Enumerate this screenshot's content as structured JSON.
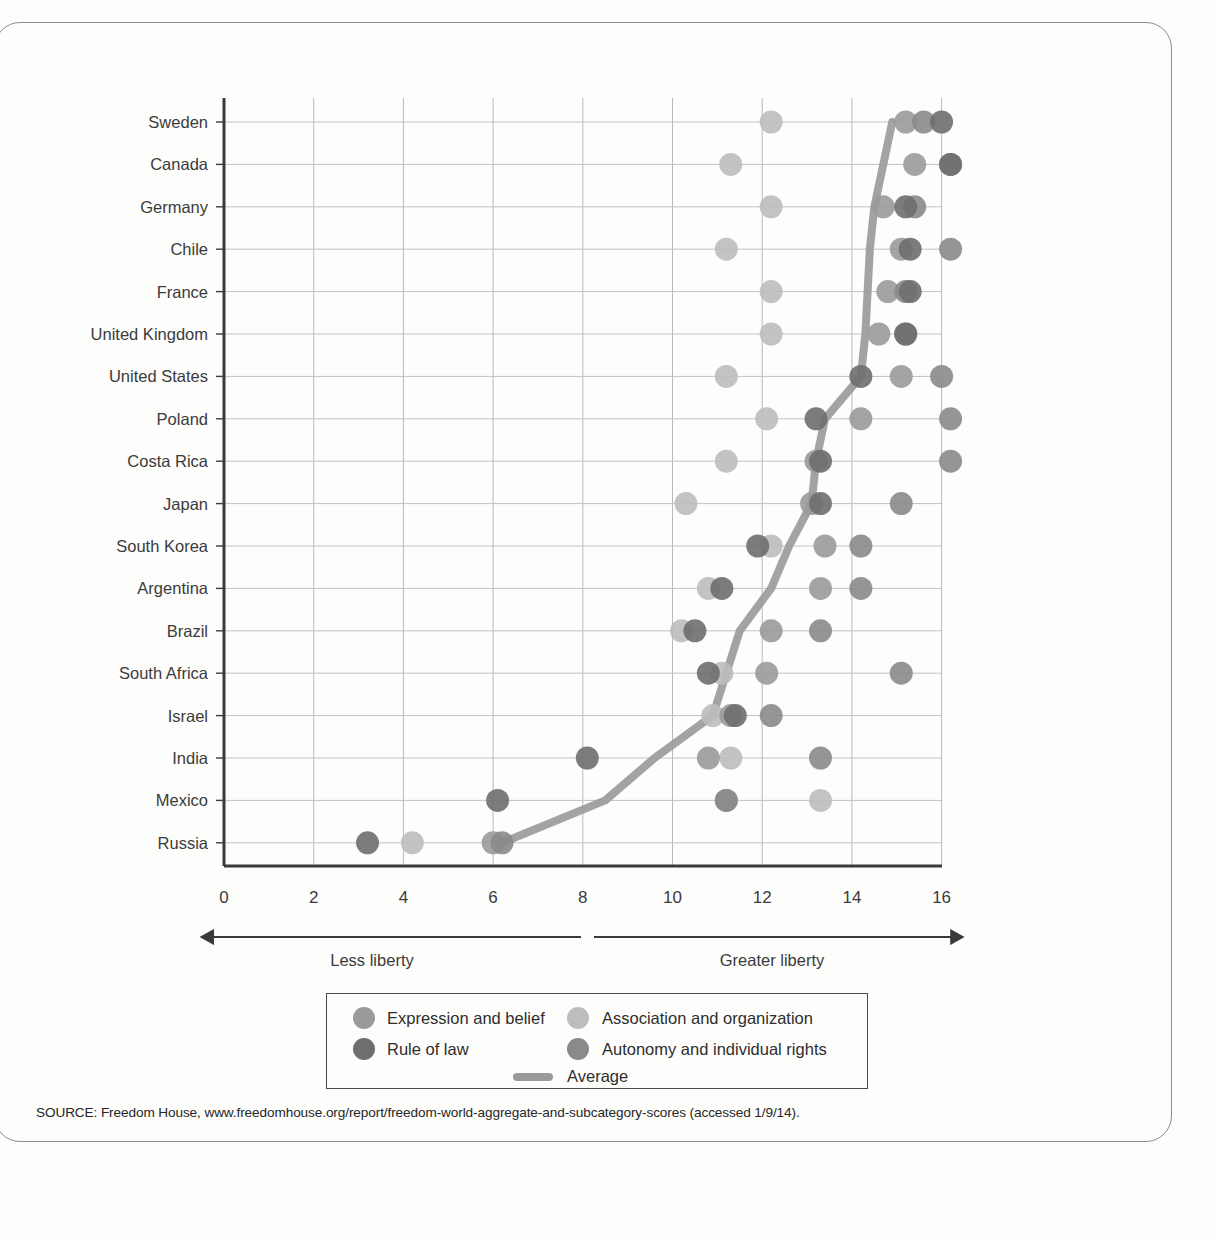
{
  "chart_data": {
    "type": "scatter",
    "title": "",
    "subtitle": "",
    "xlabel": "",
    "ylabel": "",
    "xlim": [
      0,
      16.6
    ],
    "xticks": [
      0,
      2,
      4,
      6,
      8,
      10,
      12,
      14,
      16
    ],
    "xticklabels": [
      "0",
      "2",
      "4",
      "6",
      "8",
      "10",
      "12",
      "14",
      "16"
    ],
    "grid": true,
    "legend_position": "bottom-center",
    "axis_captions": {
      "left": "Less liberty",
      "right": "Greater liberty"
    },
    "categories": [
      "Sweden",
      "Canada",
      "Germany",
      "Chile",
      "France",
      "United Kingdom",
      "United States",
      "Poland",
      "Costa Rica",
      "Japan",
      "South Korea",
      "Argentina",
      "Brazil",
      "South Africa",
      "Israel",
      "India",
      "Mexico",
      "Russia"
    ],
    "series": [
      {
        "name": "Expression and belief",
        "key": "expression",
        "color": "#9a9a9a",
        "values": [
          15.2,
          15.4,
          14.7,
          15.1,
          14.8,
          14.6,
          15.1,
          14.2,
          13.2,
          13.1,
          13.4,
          13.3,
          12.2,
          12.1,
          11.3,
          10.8,
          11.2,
          6.0
        ]
      },
      {
        "name": "Association and organization",
        "key": "association",
        "color": "#bdbdbd",
        "values": [
          12.2,
          11.3,
          12.2,
          11.2,
          12.2,
          12.2,
          11.2,
          12.1,
          11.2,
          10.3,
          12.2,
          10.8,
          10.2,
          11.1,
          10.9,
          11.3,
          13.3,
          4.2
        ]
      },
      {
        "name": "Rule of law",
        "key": "rule_of_law",
        "color": "#6e6e6e",
        "values": [
          16.0,
          16.2,
          15.2,
          15.3,
          15.3,
          15.2,
          14.2,
          13.2,
          13.3,
          13.3,
          11.9,
          11.1,
          10.5,
          10.8,
          11.4,
          8.1,
          6.1,
          3.2
        ]
      },
      {
        "name": "Autonomy and individual rights",
        "key": "autonomy",
        "color": "#8a8a8a",
        "values": [
          15.6,
          16.2,
          15.4,
          16.2,
          15.2,
          15.2,
          16.0,
          16.2,
          16.2,
          15.1,
          14.2,
          14.2,
          13.3,
          15.1,
          12.2,
          13.3,
          11.2,
          6.2
        ]
      }
    ],
    "average": {
      "name": "Average",
      "color": "#9b9b9b",
      "values": [
        14.9,
        14.7,
        14.5,
        14.4,
        14.35,
        14.3,
        14.2,
        13.4,
        13.2,
        13.1,
        12.6,
        12.2,
        11.5,
        11.2,
        10.9,
        9.6,
        8.5,
        6.2
      ]
    }
  },
  "legend": {
    "items": [
      {
        "label": "Expression and belief",
        "marker": "dot",
        "color": "#9a9a9a"
      },
      {
        "label": "Association and organization",
        "marker": "dot",
        "color": "#bdbdbd"
      },
      {
        "label": "Rule of law",
        "marker": "dot",
        "color": "#6e6e6e"
      },
      {
        "label": "Autonomy and individual rights",
        "marker": "dot",
        "color": "#8a8a8a"
      },
      {
        "label": "Average",
        "marker": "line",
        "color": "#9b9b9b"
      }
    ]
  },
  "source": {
    "text": "SOURCE: Freedom House, www.freedomhouse.org/report/freedom-world-aggregate-and-subcategory-scores (accessed 1/9/14)."
  }
}
